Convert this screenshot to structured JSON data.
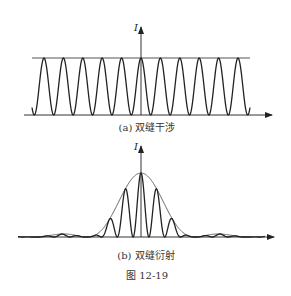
{
  "figure": {
    "caption": "图 12-19",
    "panel_a": {
      "axis_label": "I",
      "caption": "(a) 双缝干涉",
      "description": "Double-slit interference: equal-intensity cos² fringes bounded by constant maximum line"
    },
    "panel_b": {
      "axis_label": "I",
      "caption": "(b) 双缝衍射",
      "description": "Double-slit diffraction: interference fringes modulated by single-slit diffraction envelope (central maximum and secondary maxima)"
    }
  },
  "colors": {
    "line": "#222222",
    "envelope": "#666666",
    "background": "#ffffff"
  }
}
